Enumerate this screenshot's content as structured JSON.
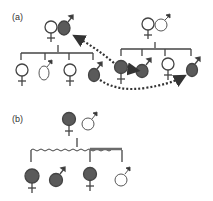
{
  "panels": [
    {
      "label": "(a)"
    },
    {
      "label": "(b)"
    }
  ],
  "colors": {
    "affected": "#5a5a5a",
    "unaffected": "#ffffff",
    "line": "#555555",
    "arrow": "#333333",
    "thick_line": "#6b6b6b"
  }
}
